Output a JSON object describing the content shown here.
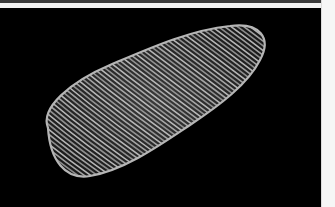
{
  "image": {
    "subject": "mushroom coral skeleton on black background",
    "alt": "Oval mushroom coral with radiating septa ridges"
  },
  "colors": {
    "background": "#000000",
    "coral_ridge": "#c8c8c8",
    "coral_shadow": "#2a2a2a",
    "frame": "#f4f4f4"
  }
}
